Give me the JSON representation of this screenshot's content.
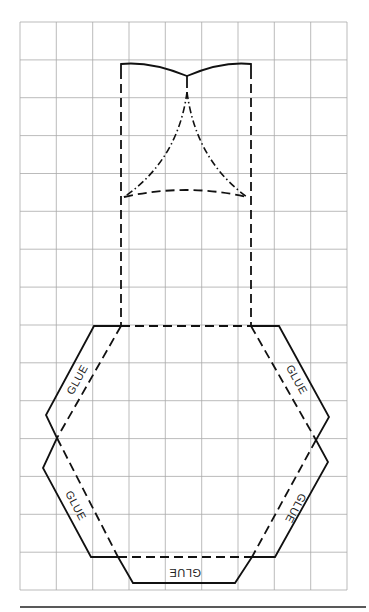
{
  "diagram": {
    "type": "paper-craft-template",
    "grid": {
      "columns": 9,
      "rows": 15,
      "left": 20,
      "top": 22,
      "cell_width": 36.33,
      "cell_height": 37.87,
      "color": "#a9a9a9"
    },
    "line_styles": {
      "solid": "cut line",
      "dashed": "fold line",
      "dash_dot": "fold line (valley)"
    },
    "labels": {
      "glue_top_left": "GLUE",
      "glue_bottom_left": "GLUE",
      "glue_top_right": "GLUE",
      "glue_bottom_right": "GLUE",
      "glue_bottom": "GLUE"
    },
    "ink_color": "#111111",
    "background": "#ffffff"
  }
}
